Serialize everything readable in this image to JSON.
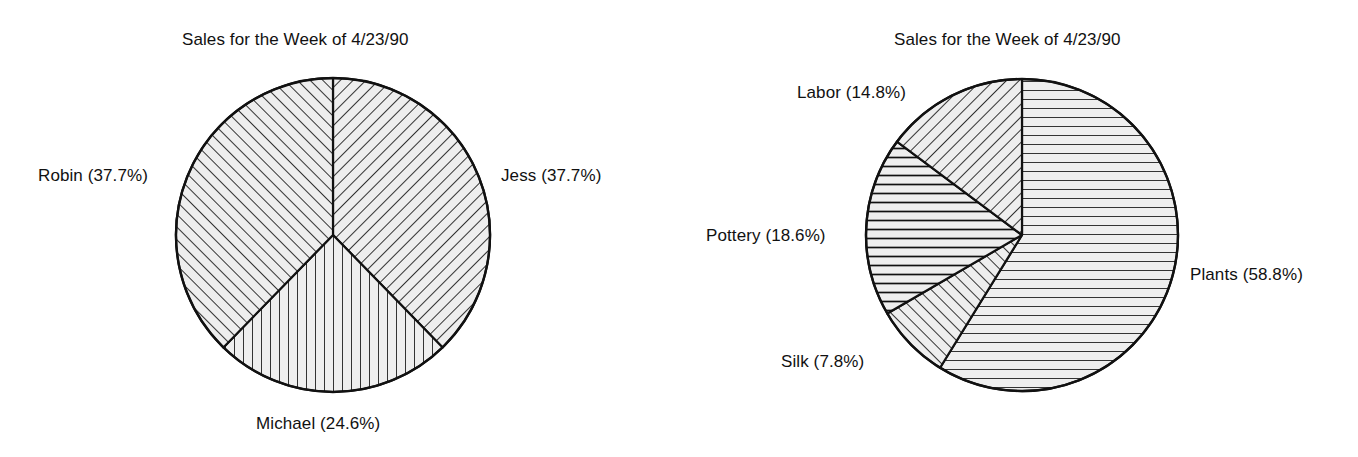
{
  "chart_data": [
    {
      "type": "pie",
      "title": "Sales for the Week of 4/23/90",
      "id": "left-pie",
      "legend_position": "callout-labels",
      "start_angle_deg": 0,
      "direction": "clockwise",
      "center": {
        "x": 333,
        "y": 235
      },
      "radius": 157,
      "categories": [
        "Jess",
        "Michael",
        "Robin"
      ],
      "values": [
        37.7,
        24.6,
        37.7
      ],
      "value_unit": "percent",
      "slices": [
        {
          "name": "Jess",
          "percent": 37.7,
          "label": "Jess (37.7%)",
          "hatch": "diagonal-backslash"
        },
        {
          "name": "Michael",
          "percent": 24.6,
          "label": "Michael (24.6%)",
          "hatch": "vertical"
        },
        {
          "name": "Robin",
          "percent": 37.7,
          "label": "Robin (37.7%)",
          "hatch": "diagonal-slash"
        }
      ]
    },
    {
      "type": "pie",
      "title": "Sales for the Week of 4/23/90",
      "id": "right-pie",
      "legend_position": "callout-labels",
      "start_angle_deg": 0,
      "direction": "clockwise",
      "center": {
        "x": 343,
        "y": 235
      },
      "radius": 156,
      "categories": [
        "Plants",
        "Silk",
        "Pottery",
        "Labor"
      ],
      "values": [
        58.8,
        7.8,
        18.6,
        14.8
      ],
      "value_unit": "percent",
      "slices": [
        {
          "name": "Plants",
          "percent": 58.8,
          "label": "Plants (58.8%)",
          "hatch": "horizontal"
        },
        {
          "name": "Silk",
          "percent": 7.8,
          "label": "Silk (7.8%)",
          "hatch": "diagonal-slash"
        },
        {
          "name": "Pottery",
          "percent": 18.6,
          "label": "Pottery (18.6%)",
          "hatch": "horizontal"
        },
        {
          "name": "Labor",
          "percent": 14.8,
          "label": "Labor (14.8%)",
          "hatch": "diagonal-backslash"
        }
      ]
    }
  ],
  "left_chart": {
    "title": "Sales for the Week of 4/23/90",
    "labels": {
      "robin": "Robin (37.7%)",
      "jess": "Jess (37.7%)",
      "michael": "Michael (24.6%)"
    }
  },
  "right_chart": {
    "title": "Sales for the Week of 4/23/90",
    "labels": {
      "labor": "Labor (14.8%)",
      "pottery": "Pottery (18.6%)",
      "silk": "Silk (7.8%)",
      "plants": "Plants (58.8%)"
    }
  },
  "colors": {
    "background": "#ffffff",
    "outline": "#111111",
    "slice_fill": "#eeeeee",
    "hatch_stroke": "#111111",
    "text": "#111111"
  }
}
